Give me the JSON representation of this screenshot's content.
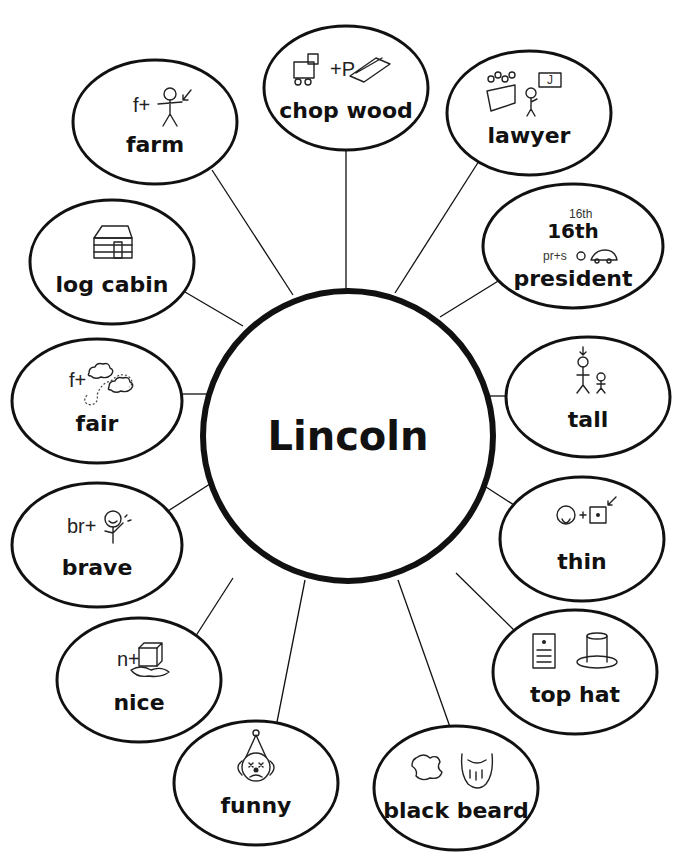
{
  "diagram": {
    "type": "word-web",
    "center": {
      "label": "Lincoln",
      "cx": 348,
      "cy": 436,
      "r": 145
    },
    "nodes": [
      {
        "id": "farm",
        "label": "farm",
        "cx": 155,
        "cy": 122,
        "rx": 82,
        "ry": 62,
        "icon": "farm-icon",
        "icon_text": "f+",
        "attach": [
          293,
          295
        ],
        "from": [
          212,
          170
        ]
      },
      {
        "id": "chop-wood",
        "label": "chop wood",
        "cx": 346,
        "cy": 88,
        "rx": 82,
        "ry": 62,
        "icon": "chop-wood-icon",
        "icon_text": "+P",
        "attach": [
          346,
          291
        ],
        "from": [
          346,
          150
        ]
      },
      {
        "id": "lawyer",
        "label": "lawyer",
        "cx": 529,
        "cy": 113,
        "rx": 82,
        "ry": 62,
        "icon": "lawyer-icon",
        "icon_text": "J",
        "attach": [
          395,
          293
        ],
        "from": [
          479,
          161
        ]
      },
      {
        "id": "16th-president",
        "label": "president",
        "sublabel": "16th",
        "cx": 573,
        "cy": 246,
        "rx": 90,
        "ry": 62,
        "icon": "president-icon",
        "icon_text": "16th",
        "icon_text2": "pr+s",
        "attach": [
          440,
          317
        ],
        "from": [
          508,
          275
        ]
      },
      {
        "id": "log-cabin",
        "label": "log cabin",
        "cx": 112,
        "cy": 262,
        "rx": 82,
        "ry": 62,
        "icon": "log-cabin-icon",
        "attach": [
          243,
          326
        ],
        "from": [
          185,
          292
        ]
      },
      {
        "id": "fair",
        "label": "fair",
        "cx": 97,
        "cy": 401,
        "rx": 85,
        "ry": 62,
        "icon": "fair-icon",
        "icon_text": "f+",
        "attach": [
          207,
          394
        ],
        "from": [
          180,
          394
        ]
      },
      {
        "id": "tall",
        "label": "tall",
        "cx": 588,
        "cy": 397,
        "rx": 82,
        "ry": 60,
        "icon": "tall-icon",
        "attach": [
          489,
          396
        ],
        "from": [
          506,
          396
        ]
      },
      {
        "id": "brave",
        "label": "brave",
        "cx": 97,
        "cy": 545,
        "rx": 85,
        "ry": 62,
        "icon": "brave-icon",
        "icon_text": "br+",
        "attach": [
          213,
          482
        ],
        "from": [
          168,
          511
        ]
      },
      {
        "id": "thin",
        "label": "thin",
        "cx": 582,
        "cy": 539,
        "rx": 82,
        "ry": 62,
        "icon": "thin-icon",
        "attach": [
          486,
          487
        ],
        "from": [
          514,
          505
        ]
      },
      {
        "id": "nice",
        "label": "nice",
        "cx": 139,
        "cy": 680,
        "rx": 82,
        "ry": 62,
        "icon": "nice-icon",
        "icon_text": "n+",
        "attach": [
          233,
          578
        ],
        "from": [
          190,
          645
        ]
      },
      {
        "id": "top-hat",
        "label": "top hat",
        "cx": 575,
        "cy": 672,
        "rx": 82,
        "ry": 62,
        "icon": "top-hat-icon",
        "attach": [
          456,
          573
        ],
        "from": [
          516,
          632
        ]
      },
      {
        "id": "funny",
        "label": "funny",
        "cx": 256,
        "cy": 783,
        "rx": 82,
        "ry": 62,
        "icon": "funny-icon",
        "attach": [
          305,
          580
        ],
        "from": [
          277,
          722
        ]
      },
      {
        "id": "black-beard",
        "label": "black beard",
        "cx": 456,
        "cy": 788,
        "rx": 82,
        "ry": 62,
        "icon": "black-beard-icon",
        "attach": [
          398,
          580
        ],
        "from": [
          450,
          727
        ]
      }
    ]
  },
  "colors": {
    "ink": "#111111",
    "background": "#ffffff"
  }
}
